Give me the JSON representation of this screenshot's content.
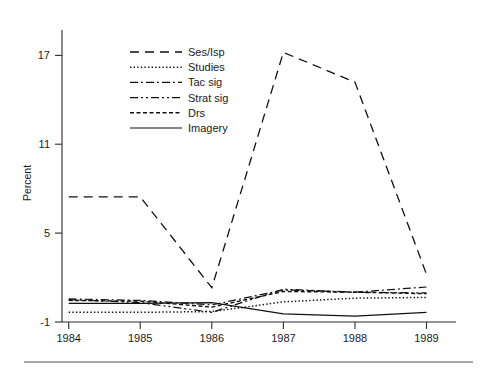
{
  "figure": {
    "background_color": "#ffffff",
    "line_color": "#111111",
    "axis_color": "#2b2b2b",
    "has_footer_rule": true
  },
  "chart_data": {
    "type": "line",
    "title": "",
    "xlabel": "",
    "ylabel": "Percent",
    "x": [
      1984,
      1985,
      1986,
      1987,
      1988,
      1989
    ],
    "xtick_labels": [
      "1984",
      "1985",
      "1986",
      "1987",
      "1988",
      "1989"
    ],
    "ytick_values": [
      -1,
      5,
      11,
      17
    ],
    "ytick_labels": [
      "-1",
      "5",
      "11",
      "17"
    ],
    "xlim": [
      1983.75,
      1989.25
    ],
    "ylim": [
      -1,
      18.6
    ],
    "grid": false,
    "legend_position": "upper-left-inside",
    "series": [
      {
        "name": "Ses/Isp",
        "dash": "long-dash",
        "dasharray": "9,6",
        "width": 1.3,
        "values": [
          7.4,
          7.4,
          1.3,
          17.1,
          15.1,
          2.2
        ]
      },
      {
        "name": "Studies",
        "dash": "dotted",
        "dasharray": "1.4,2.2",
        "width": 1.5,
        "values": [
          -0.35,
          -0.35,
          -0.3,
          0.35,
          0.6,
          0.65
        ]
      },
      {
        "name": "Tac sig",
        "dash": "dash-dot",
        "dasharray": "8,3,2,3",
        "width": 1.2,
        "values": [
          0.55,
          0.45,
          0.15,
          1.15,
          1.0,
          1.35
        ]
      },
      {
        "name": "Strat sig",
        "dash": "dash-dot-dot",
        "dasharray": "8,3,2,3,2,3",
        "width": 1.2,
        "values": [
          0.5,
          0.3,
          -0.35,
          1.2,
          1.0,
          0.95
        ]
      },
      {
        "name": "Drs",
        "dash": "short-dash",
        "dasharray": "4,2.5",
        "width": 1.4,
        "values": [
          0.45,
          0.4,
          0.0,
          1.05,
          1.0,
          0.9
        ]
      },
      {
        "name": "Imagery",
        "dash": "solid",
        "dasharray": "none",
        "width": 1.2,
        "values": [
          0.25,
          0.25,
          0.3,
          -0.45,
          -0.6,
          -0.35
        ]
      }
    ]
  }
}
